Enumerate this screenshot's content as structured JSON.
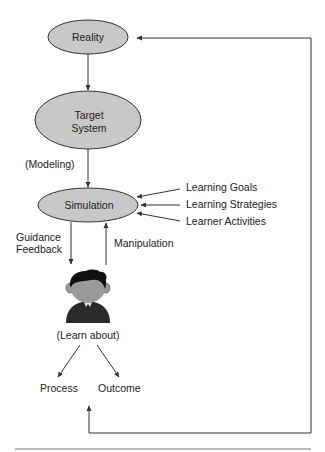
{
  "nodes": {
    "reality": "Reality",
    "target_system_line1": "Target",
    "target_system_line2": "System",
    "simulation": "Simulation"
  },
  "labels": {
    "modeling": "(Modeling)",
    "learning_goals": "Learning Goals",
    "learning_strategies": "Learning Strategies",
    "learner_activities": "Learner Activities",
    "guidance": "Guidance",
    "feedback": "Feedback",
    "manipulation": "Manipulation",
    "learn_about": "(Learn about)",
    "process": "Process",
    "outcome": "Outcome"
  },
  "colors": {
    "ellipse_fill": "#c8c8c8",
    "stroke": "#333333",
    "hair": "#111111",
    "skin": "#9a9a9a",
    "body": "#2a2a2a"
  }
}
